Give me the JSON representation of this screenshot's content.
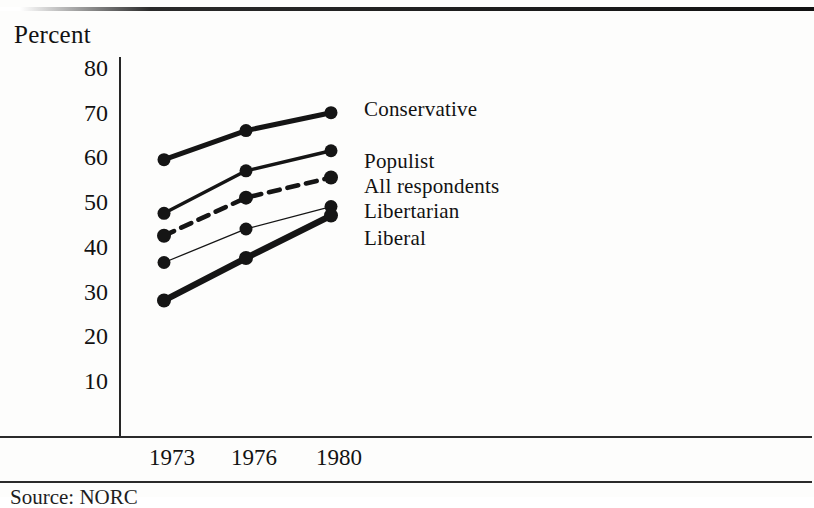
{
  "figure": {
    "axis_title": "Percent",
    "source_note": "Source: NORC"
  },
  "chart_data": {
    "type": "line",
    "title": "Percent",
    "xlabel": "",
    "ylabel": "Percent",
    "categories": [
      "1973",
      "1976",
      "1980"
    ],
    "x": [
      1973,
      1976,
      1980
    ],
    "ylim": [
      0,
      85
    ],
    "yticks": [
      80,
      70,
      60,
      50,
      40,
      30,
      20,
      10
    ],
    "grid": false,
    "legend_position": "right-inline",
    "series": [
      {
        "name": "Conservative",
        "values": [
          59.5,
          66.0,
          70.0
        ],
        "style": "solid-thick",
        "color": "#151515"
      },
      {
        "name": "Populist",
        "values": [
          47.5,
          57.0,
          61.5
        ],
        "style": "solid-medium",
        "color": "#151515"
      },
      {
        "name": "All respondents",
        "values": [
          42.5,
          51.0,
          55.5
        ],
        "style": "dashed",
        "color": "#151515"
      },
      {
        "name": "Libertarian",
        "values": [
          36.5,
          44.0,
          49.0
        ],
        "style": "solid-thin",
        "color": "#151515"
      },
      {
        "name": "Liberal",
        "values": [
          28.0,
          37.5,
          47.0
        ],
        "style": "solid-heavy",
        "color": "#151515"
      }
    ]
  },
  "y_axis": {
    "ticks": [
      {
        "label": "80",
        "value": 80
      },
      {
        "label": "70",
        "value": 70
      },
      {
        "label": "60",
        "value": 60
      },
      {
        "label": "50",
        "value": 50
      },
      {
        "label": "40",
        "value": 40
      },
      {
        "label": "30",
        "value": 30
      },
      {
        "label": "20",
        "value": 20
      },
      {
        "label": "10",
        "value": 10
      }
    ]
  },
  "x_axis": {
    "ticks": [
      {
        "label": "1973",
        "value": 1973
      },
      {
        "label": "1976",
        "value": 1976
      },
      {
        "label": "1980",
        "value": 1980
      }
    ]
  },
  "legend": {
    "items": [
      {
        "label": "Conservative"
      },
      {
        "label": "Populist"
      },
      {
        "label": "All respondents"
      },
      {
        "label": "Libertarian"
      },
      {
        "label": "Liberal"
      }
    ]
  }
}
